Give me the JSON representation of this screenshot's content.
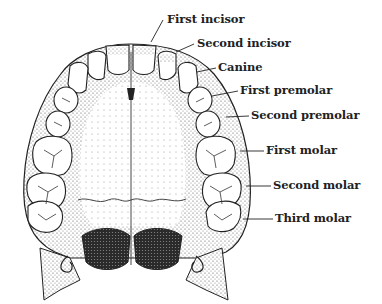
{
  "figure": {
    "colors": {
      "ink": "#222222",
      "shade": "#6a6a6a",
      "dark": "#333333",
      "paper": "#ffffff"
    }
  },
  "labels": [
    {
      "id": "first-incisor",
      "text": "First incisor",
      "x": 167,
      "y": 14,
      "lx1": 163,
      "ly1": 20,
      "lx2": 151,
      "ly2": 42
    },
    {
      "id": "second-incisor",
      "text": "Second incisor",
      "x": 197,
      "y": 38,
      "lx1": 194,
      "ly1": 44,
      "lx2": 176,
      "ly2": 52
    },
    {
      "id": "canine",
      "text": "Canine",
      "x": 218,
      "y": 62,
      "lx1": 216,
      "ly1": 68,
      "lx2": 197,
      "ly2": 72
    },
    {
      "id": "first-premolar",
      "text": "First premolar",
      "x": 240,
      "y": 85,
      "lx1": 238,
      "ly1": 91,
      "lx2": 212,
      "ly2": 96
    },
    {
      "id": "second-premolar",
      "text": "Second premolar",
      "x": 251,
      "y": 110,
      "lx1": 249,
      "ly1": 116,
      "lx2": 226,
      "ly2": 117
    },
    {
      "id": "first-molar",
      "text": "First molar",
      "x": 266,
      "y": 145,
      "lx1": 264,
      "ly1": 151,
      "lx2": 240,
      "ly2": 151
    },
    {
      "id": "second-molar",
      "text": "Second molar",
      "x": 273,
      "y": 180,
      "lx1": 271,
      "ly1": 186,
      "lx2": 246,
      "ly2": 186
    },
    {
      "id": "third-molar",
      "text": "Third molar",
      "x": 275,
      "y": 213,
      "lx1": 273,
      "ly1": 219,
      "lx2": 243,
      "ly2": 219
    }
  ]
}
